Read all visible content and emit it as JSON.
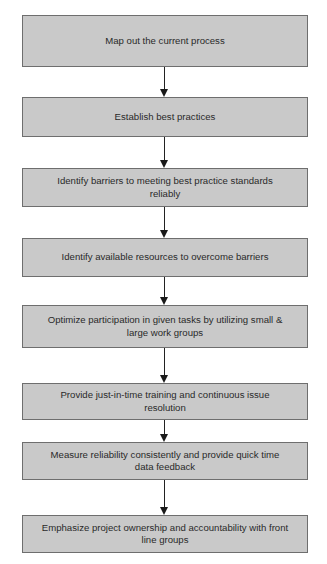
{
  "diagram": {
    "type": "flowchart",
    "direction": "top-to-bottom",
    "colors": {
      "box_fill": "#c9c9c9",
      "box_border": "#6e6e6e",
      "text": "#2a2a2a",
      "arrow": "#1a1a1a",
      "background": "#ffffff"
    },
    "steps": [
      {
        "label": "Map out the current process"
      },
      {
        "label": "Establish best practices"
      },
      {
        "label": "Identify barriers to meeting best practice standards reliably"
      },
      {
        "label": "Identify available resources to overcome barriers"
      },
      {
        "label": "Optimize participation in given tasks by utilizing small & large work groups"
      },
      {
        "label": "Provide just-in-time training and continuous issue resolution"
      },
      {
        "label": "Measure reliability consistently and provide quick time data feedback"
      },
      {
        "label": "Emphasize project ownership and accountability with front line groups"
      }
    ],
    "edges": [
      {
        "from": 0,
        "to": 1
      },
      {
        "from": 1,
        "to": 2
      },
      {
        "from": 2,
        "to": 3
      },
      {
        "from": 3,
        "to": 4
      },
      {
        "from": 4,
        "to": 5
      },
      {
        "from": 5,
        "to": 6
      },
      {
        "from": 6,
        "to": 7
      }
    ]
  }
}
